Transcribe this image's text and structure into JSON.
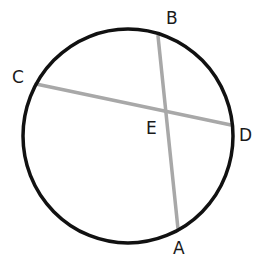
{
  "diagram": {
    "type": "circle-with-intersecting-chords",
    "colors": {
      "circle": "#111111",
      "chord": "#a8a8a8",
      "label": "#1a1a1a",
      "background": "#ffffff"
    },
    "circle": {
      "cx": 128,
      "cy": 136,
      "rx": 105,
      "ry": 107
    },
    "points": {
      "A": {
        "label": "A",
        "x": 178,
        "y": 229
      },
      "B": {
        "label": "B",
        "x": 158,
        "y": 36
      },
      "C": {
        "label": "C",
        "x": 36,
        "y": 84
      },
      "D": {
        "label": "D",
        "x": 231,
        "y": 125
      },
      "E": {
        "label": "E",
        "x": 165,
        "y": 112
      }
    },
    "chords": [
      {
        "name": "AB",
        "from": "A",
        "to": "B"
      },
      {
        "name": "CD",
        "from": "C",
        "to": "D"
      }
    ],
    "labels": {
      "A": "A",
      "B": "B",
      "C": "C",
      "D": "D",
      "E": "E"
    }
  }
}
